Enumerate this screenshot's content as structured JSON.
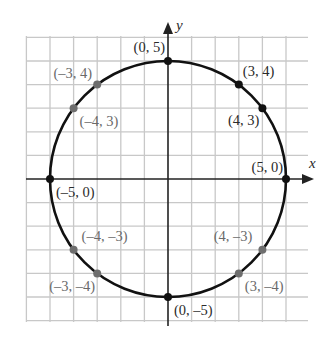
{
  "figure": {
    "axes": {
      "x_label": "x",
      "y_label": "y"
    },
    "grid": {
      "min": -6,
      "max": 6,
      "step": 1
    },
    "circle": {
      "radius": 5,
      "center": [
        0,
        0
      ]
    },
    "colors": {
      "grid": "#c8c8c8",
      "axis": "#222222",
      "circle": "#111111",
      "point_black": "#111111",
      "point_gray": "#6e6e6e",
      "label_black": "#2a2a2a",
      "label_gray": "#6a6a6a"
    },
    "points": [
      {
        "id": "p-0-5",
        "x": 0,
        "y": 5,
        "label": "(0, 5)",
        "tone": "black",
        "lx": -3,
        "ly": -9,
        "anchor": "end"
      },
      {
        "id": "p-3-4",
        "x": 3,
        "y": 4,
        "label": "(3, 4)",
        "tone": "black",
        "lx": 4,
        "ly": -9,
        "anchor": "start"
      },
      {
        "id": "p-4-3",
        "x": 4,
        "y": 3,
        "label": "(4, 3)",
        "tone": "black",
        "lx": -3,
        "ly": 17,
        "anchor": "end"
      },
      {
        "id": "p-5-0",
        "x": 5,
        "y": 0,
        "label": "(5, 0)",
        "tone": "black",
        "lx": -3,
        "ly": -7,
        "anchor": "end"
      },
      {
        "id": "p-m5-0",
        "x": -5,
        "y": 0,
        "label": "(–5, 0)",
        "tone": "black",
        "lx": 6,
        "ly": 18,
        "anchor": "start"
      },
      {
        "id": "p-0-m5",
        "x": 0,
        "y": -5,
        "label": "(0, –5)",
        "tone": "black",
        "lx": 6,
        "ly": 18,
        "anchor": "start"
      },
      {
        "id": "p-m3-4",
        "x": -3,
        "y": 4,
        "label": "(–3, 4)",
        "tone": "gray",
        "lx": -5,
        "ly": -7,
        "anchor": "end"
      },
      {
        "id": "p-m4-3",
        "x": -4,
        "y": 3,
        "label": "(–4, 3)",
        "tone": "gray",
        "lx": 6,
        "ly": 18,
        "anchor": "start"
      },
      {
        "id": "p-m4-m3",
        "x": -4,
        "y": -3,
        "label": "(–4, –3)",
        "tone": "gray",
        "lx": 8,
        "ly": -9,
        "anchor": "start"
      },
      {
        "id": "p-m3-m4",
        "x": -3,
        "y": -4,
        "label": "(–3, –4)",
        "tone": "gray",
        "lx": -2,
        "ly": 18,
        "anchor": "end"
      },
      {
        "id": "p-4-m3",
        "x": 4,
        "y": -3,
        "label": "(4, –3)",
        "tone": "gray",
        "lx": -10,
        "ly": -9,
        "anchor": "end"
      },
      {
        "id": "p-3-m4",
        "x": 3,
        "y": -4,
        "label": "(3, –4)",
        "tone": "gray",
        "lx": 6,
        "ly": 18,
        "anchor": "start"
      }
    ]
  }
}
